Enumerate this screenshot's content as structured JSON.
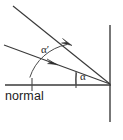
{
  "figure": {
    "kind": "optics-reflection-diagram",
    "width": 123,
    "height": 140,
    "background_color": "#ffffff",
    "ink_color": "#3a3a3a"
  },
  "labels": {
    "normal": "normal",
    "angle_incidence": "α",
    "angle_reflection": "α′"
  },
  "geometry": {
    "vertex": {
      "x": 110,
      "y": 84
    },
    "surface": {
      "x": 110,
      "y_top": 25,
      "y_bottom": 122
    },
    "normal_axis": {
      "x_start": 5,
      "x_end": 111,
      "y": 85
    },
    "incident_ray": {
      "x1": 13,
      "y1": 6,
      "x2": 110,
      "y2": 84
    },
    "reflected_ray": {
      "x1": 4,
      "y1": 45,
      "x2": 110,
      "y2": 84
    },
    "arrow_incident": {
      "x": 68,
      "y": 42
    },
    "arrow_reflected": {
      "x": 53,
      "y": 63
    },
    "tick_on_normal": {
      "x": 32,
      "y": 85
    },
    "tick_near_vertex": {
      "x": 76,
      "y": 85
    },
    "arc_alpha_prime_radius": 48,
    "arc_alpha_radius": 35
  },
  "label_positions": {
    "alpha_prime": {
      "x": 41,
      "y": 52
    },
    "alpha": {
      "x": 76,
      "y": 78
    },
    "normal_text": {
      "x": 6,
      "y": 100
    }
  }
}
